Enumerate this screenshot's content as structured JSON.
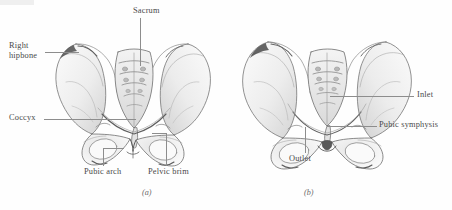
{
  "figure": {
    "background_color": "#fefefe",
    "label_color": "#4a4a4a",
    "leader_color": "#8d8d8d",
    "ink_color": "#555555"
  },
  "panels": [
    {
      "id": "a",
      "caption": "(a)",
      "subject": "male-pelvis",
      "labels": [
        {
          "name": "sacrum",
          "text": "Sacrum"
        },
        {
          "name": "right-hipbone",
          "text": "Right",
          "text2": "hipbone"
        },
        {
          "name": "coccyx",
          "text": "Coccyx"
        },
        {
          "name": "pubic-arch",
          "text": "Pubic arch"
        },
        {
          "name": "pelvic-brim",
          "text": "Pelvic brim"
        }
      ]
    },
    {
      "id": "b",
      "caption": "(b)",
      "subject": "female-pelvis",
      "labels": [
        {
          "name": "inlet",
          "text": "Inlet"
        },
        {
          "name": "pubic-symphysis",
          "text": "Pubic symphysis"
        },
        {
          "name": "outlet",
          "text": "Outlet"
        }
      ]
    }
  ],
  "label_text": {
    "sacrum": "Sacrum",
    "right_hipbone_line1": "Right",
    "right_hipbone_line2": "hipbone",
    "coccyx": "Coccyx",
    "pubic_arch": "Pubic arch",
    "pelvic_brim": "Pelvic brim",
    "inlet": "Inlet",
    "pubic_symphysis": "Pubic symphysis",
    "outlet": "Outlet",
    "caption_a": "(a)",
    "caption_b": "(b)"
  }
}
